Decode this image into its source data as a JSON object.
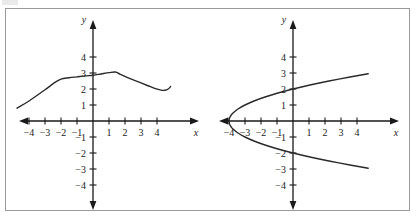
{
  "figure": {
    "background_color": "#ffffff",
    "frame_color": "#9a9a9a",
    "curve_color": "#2a2a2a",
    "axis_color": "#1a1a1a"
  },
  "chart_data": [
    {
      "type": "line",
      "title": "",
      "xlabel": "x",
      "ylabel": "y",
      "xlim": [
        -5.2,
        5.2
      ],
      "ylim": [
        -5.0,
        5.0
      ],
      "grid": false,
      "legend": "none",
      "xticks": [
        -4,
        -3,
        -2,
        -1,
        1,
        2,
        3,
        4
      ],
      "yticks": [
        -4,
        -3,
        -2,
        -1,
        1,
        2,
        3,
        4
      ],
      "xticklabels": [
        "-4",
        "-3",
        "-2",
        "-1",
        "1",
        "2",
        "3",
        "4"
      ],
      "yticklabels": [
        "-4",
        "-3",
        "-2",
        "-1",
        "1",
        "2",
        "3",
        "4"
      ],
      "series": [
        {
          "name": "curve-left",
          "x": [
            -4.75,
            -4.0,
            -3.0,
            -2.4,
            -2.0,
            -1.5,
            -1.0,
            -0.5,
            0.0,
            0.5,
            1.0,
            1.4,
            1.7,
            2.2,
            2.8,
            3.4,
            3.9,
            4.25,
            4.5,
            4.7,
            4.85
          ],
          "y": [
            0.8,
            1.25,
            1.95,
            2.4,
            2.62,
            2.7,
            2.76,
            2.82,
            2.86,
            2.94,
            3.02,
            3.06,
            2.92,
            2.7,
            2.46,
            2.22,
            2.02,
            1.93,
            1.92,
            2.0,
            2.15
          ]
        }
      ]
    },
    {
      "type": "line",
      "title": "",
      "xlabel": "x",
      "ylabel": "y",
      "xlim": [
        -5.2,
        5.2
      ],
      "ylim": [
        -5.0,
        5.0
      ],
      "grid": false,
      "legend": "none",
      "xticks": [
        -4,
        -3,
        -2,
        -1,
        1,
        2,
        3,
        4
      ],
      "yticks": [
        -4,
        -3,
        -2,
        -1,
        1,
        2,
        3,
        4
      ],
      "xticklabels": [
        "-4",
        "-3",
        "-2",
        "-1",
        "1",
        "2",
        "3",
        "4"
      ],
      "yticklabels": [
        "-4",
        "-3",
        "-2",
        "-1",
        "1",
        "2",
        "3",
        "4"
      ],
      "series": [
        {
          "name": "parabola-upper-branch",
          "x": [
            -4.0,
            -3.97,
            -3.87,
            -3.75,
            -3.44,
            -3.0,
            -2.44,
            -1.75,
            -0.94,
            0.0,
            1.06,
            2.25,
            3.56,
            4.7
          ],
          "y": [
            0.0,
            0.18,
            0.36,
            0.5,
            0.75,
            1.0,
            1.25,
            1.5,
            1.75,
            2.0,
            2.25,
            2.5,
            2.75,
            2.95
          ]
        },
        {
          "name": "parabola-lower-branch",
          "x": [
            -4.0,
            -3.97,
            -3.87,
            -3.75,
            -3.44,
            -3.0,
            -2.44,
            -1.75,
            -0.94,
            0.0,
            1.06,
            2.25,
            3.56,
            4.7
          ],
          "y": [
            0.0,
            -0.18,
            -0.36,
            -0.5,
            -0.75,
            -1.0,
            -1.25,
            -1.5,
            -1.75,
            -2.0,
            -2.25,
            -2.5,
            -2.75,
            -2.95
          ]
        }
      ],
      "annotations": [
        {
          "label": "vertex",
          "x": -4,
          "y": 0
        },
        {
          "label": "y-intercept-upper",
          "x": 0,
          "y": 2
        },
        {
          "label": "y-intercept-lower",
          "x": 0,
          "y": -2
        }
      ]
    }
  ]
}
